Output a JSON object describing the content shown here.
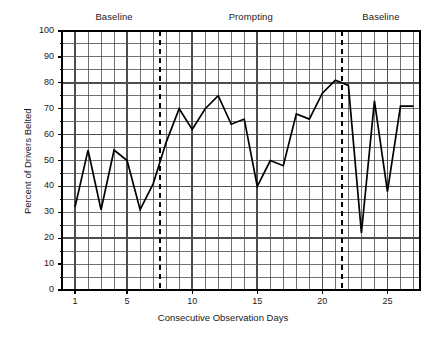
{
  "chart_data": {
    "type": "line",
    "title": "",
    "xlabel": "Consecutive Observation Days",
    "ylabel": "Percent of Drivers Belted",
    "xlim": [
      0,
      27.5
    ],
    "ylim": [
      0,
      100
    ],
    "grid": true,
    "legend_position": "none",
    "x_ticks": [
      1,
      5,
      10,
      15,
      20,
      25
    ],
    "y_ticks": [
      0,
      10,
      20,
      30,
      40,
      50,
      60,
      70,
      80,
      90,
      100
    ],
    "x_major_gridlines": [
      1,
      5,
      10,
      15,
      20,
      25
    ],
    "y_major_gridlines": [
      0,
      20,
      40,
      60,
      80,
      100
    ],
    "x": [
      1,
      2,
      3,
      4,
      5,
      6,
      7,
      8,
      9,
      10,
      11,
      12,
      13,
      14,
      15,
      16,
      17,
      18,
      19,
      20,
      21,
      22,
      23,
      24,
      25,
      26,
      27
    ],
    "values": [
      32,
      54,
      31,
      54,
      50,
      31,
      41,
      57,
      70,
      62,
      70,
      75,
      64,
      66,
      40,
      50,
      48,
      68,
      66,
      76,
      81,
      79,
      22,
      73,
      38,
      71,
      71
    ],
    "series": [
      {
        "name": "Percent of Drivers Belted",
        "values": [
          32,
          54,
          31,
          54,
          50,
          31,
          41,
          57,
          70,
          62,
          70,
          75,
          64,
          66,
          40,
          50,
          48,
          68,
          66,
          76,
          81,
          79,
          22,
          73,
          38,
          71,
          71
        ]
      }
    ],
    "phases": [
      {
        "label": "Baseline",
        "start_day": 1,
        "end_day": 7
      },
      {
        "label": "Prompting",
        "start_day": 8,
        "end_day": 21
      },
      {
        "label": "Baseline",
        "start_day": 22,
        "end_day": 27
      }
    ],
    "phase_change_lines": [
      7.5,
      21.5
    ],
    "phase_change_style": "dashed",
    "line_color": "#000000",
    "grid_color": "#4d4d4d",
    "axis_color": "#000000"
  },
  "axes": {
    "y_title": "Percent of Drivers Belted",
    "x_title": "Consecutive Observation Days",
    "y_tick_labels": [
      "100",
      "90",
      "80",
      "70",
      "60",
      "50",
      "40",
      "30",
      "20",
      "10",
      "0"
    ],
    "x_tick_labels": [
      "1",
      "5",
      "10",
      "15",
      "20",
      "25"
    ]
  },
  "phase_labels": {
    "first": "Baseline",
    "second": "Prompting",
    "third": "Baseline"
  }
}
